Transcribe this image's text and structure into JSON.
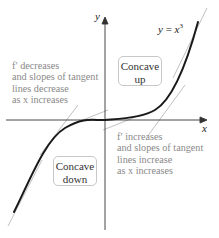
{
  "diagram": {
    "type": "concavity-illustration",
    "function_label": {
      "var_y": "y",
      "equals": " = ",
      "var_x": "x",
      "exponent": "3"
    },
    "axes": {
      "x_label": "x",
      "y_label": "y"
    },
    "regions": [
      {
        "id": "concave-up",
        "lines": [
          "Concave",
          "up"
        ]
      },
      {
        "id": "concave-down",
        "lines": [
          "Concave",
          "down"
        ]
      }
    ],
    "annotations": {
      "left": {
        "lines": [
          "f′ decreases",
          "and slopes of tangent",
          "lines decrease",
          "as x increases"
        ]
      },
      "right": {
        "lines": [
          "f′ increases",
          "and slopes of tangent",
          "lines increase",
          "as x increases"
        ]
      }
    },
    "colors": {
      "curve": "#1a1a1a",
      "axes": "#333333",
      "tangent_lines": "#b0b0b0",
      "annotation_text": "#8a8a8a",
      "box_border": "#c8c8c8"
    }
  }
}
